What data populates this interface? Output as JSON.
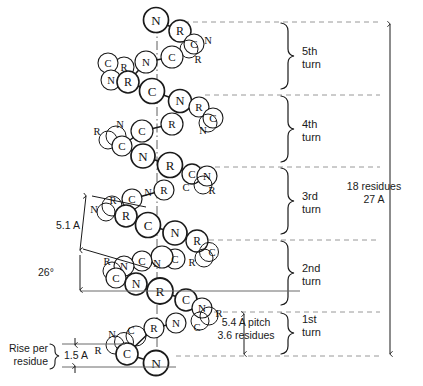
{
  "figure": {
    "background_color": "#ffffff",
    "ink_color": "#1a1a1a"
  },
  "turn_brackets": [
    {
      "label": "5th\nturn",
      "index": 5
    },
    {
      "label": "4th\nturn",
      "index": 4
    },
    {
      "label": "3rd\nturn",
      "index": 3
    },
    {
      "label": "2nd\nturn",
      "index": 2
    },
    {
      "label": "1st\nturn",
      "index": 1
    }
  ],
  "annotations": {
    "total_span": "18 residues\n27 A",
    "pitch": "5.4 A pitch\n3.6 residues",
    "radius": "5.1 A",
    "angle": "26°",
    "rise_label": "Rise per\nresidue",
    "rise_value": "1.5 A"
  },
  "atom_labels": {
    "nitrogen": "N",
    "carbon": "C",
    "residue": "R"
  },
  "helix_chain": [
    {
      "t": "N",
      "x": 156,
      "y": 20,
      "r": 12.5,
      "big": true
    },
    {
      "t": "R",
      "x": 180,
      "y": 31,
      "r": 11,
      "big": true
    },
    {
      "t": "C",
      "x": 194,
      "y": 44,
      "r": 10,
      "big": false
    },
    {
      "t": "N",
      "x": 206,
      "y": 40,
      "r": 0,
      "big": false
    },
    {
      "t": "C",
      "x": 172,
      "y": 57,
      "r": 11,
      "big": false
    },
    {
      "t": "R",
      "x": 196,
      "y": 58,
      "r": 0,
      "big": false
    },
    {
      "t": "N",
      "x": 146,
      "y": 62,
      "r": 11,
      "big": false
    },
    {
      "t": "R",
      "x": 124,
      "y": 67,
      "r": 10,
      "big": false
    },
    {
      "t": "C",
      "x": 108,
      "y": 63,
      "r": 10,
      "big": false
    },
    {
      "t": "N",
      "x": 111,
      "y": 80,
      "r": 10,
      "big": false
    },
    {
      "t": "R",
      "x": 128,
      "y": 82,
      "r": 11,
      "big": true
    },
    {
      "t": "C",
      "x": 152,
      "y": 91,
      "r": 12.5,
      "big": true
    },
    {
      "t": "N",
      "x": 180,
      "y": 101,
      "r": 11.5,
      "big": true
    },
    {
      "t": "R",
      "x": 199,
      "y": 107,
      "r": 10,
      "big": false
    },
    {
      "t": "C",
      "x": 213,
      "y": 118,
      "r": 10,
      "big": false
    },
    {
      "t": "N",
      "x": 200,
      "y": 128,
      "r": 0,
      "big": false
    },
    {
      "t": "R",
      "x": 172,
      "y": 124,
      "r": 11,
      "big": false
    },
    {
      "t": "C",
      "x": 142,
      "y": 131,
      "r": 11,
      "big": false
    },
    {
      "t": "N",
      "x": 120,
      "y": 127,
      "r": 0,
      "big": false
    },
    {
      "t": "R",
      "x": 100,
      "y": 131,
      "r": 0,
      "big": false
    },
    {
      "t": "C",
      "x": 122,
      "y": 146,
      "r": 10,
      "big": false
    },
    {
      "t": "N",
      "x": 143,
      "y": 156,
      "r": 12,
      "big": true
    },
    {
      "t": "R",
      "x": 170,
      "y": 165,
      "r": 12.5,
      "big": true
    },
    {
      "t": "C",
      "x": 192,
      "y": 174,
      "r": 10,
      "big": false
    },
    {
      "t": "N",
      "x": 207,
      "y": 176,
      "r": 10,
      "big": false
    },
    {
      "t": "R",
      "x": 213,
      "y": 190,
      "r": 0,
      "big": false
    },
    {
      "t": "C",
      "x": 183,
      "y": 188,
      "r": 0,
      "big": false
    },
    {
      "t": "R",
      "x": 164,
      "y": 190,
      "r": 10,
      "big": false
    },
    {
      "t": "N",
      "x": 151,
      "y": 195,
      "r": 0,
      "big": false
    },
    {
      "t": "C",
      "x": 132,
      "y": 199,
      "r": 10,
      "big": false
    },
    {
      "t": "R",
      "x": 111,
      "y": 204,
      "r": 0,
      "big": false
    },
    {
      "t": "N",
      "x": 97,
      "y": 211,
      "r": 0,
      "big": false
    },
    {
      "t": "R",
      "x": 126,
      "y": 216,
      "r": 11,
      "big": true
    },
    {
      "t": "C",
      "x": 148,
      "y": 225,
      "r": 12.5,
      "big": true
    },
    {
      "t": "N",
      "x": 175,
      "y": 233,
      "r": 12,
      "big": true
    },
    {
      "t": "R",
      "x": 197,
      "y": 241,
      "r": 11,
      "big": false
    },
    {
      "t": "C",
      "x": 211,
      "y": 250,
      "r": 0,
      "big": false
    },
    {
      "t": "R",
      "x": 190,
      "y": 259,
      "r": 0,
      "big": false
    },
    {
      "t": "C",
      "x": 175,
      "y": 259,
      "r": 10,
      "big": false
    },
    {
      "t": "N",
      "x": 157,
      "y": 262,
      "r": 0,
      "big": false
    },
    {
      "t": "R",
      "x": 162,
      "y": 257,
      "r": 11,
      "big": false
    },
    {
      "t": "C",
      "x": 142,
      "y": 261,
      "r": 10,
      "big": false
    },
    {
      "t": "N",
      "x": 124,
      "y": 266,
      "r": 10,
      "big": false
    },
    {
      "t": "R",
      "x": 110,
      "y": 262,
      "r": 0,
      "big": false
    },
    {
      "t": "C",
      "x": 116,
      "y": 278,
      "r": 10,
      "big": false
    },
    {
      "t": "N",
      "x": 136,
      "y": 284,
      "r": 11,
      "big": true
    },
    {
      "t": "R",
      "x": 160,
      "y": 291,
      "r": 13,
      "big": true
    },
    {
      "t": "C",
      "x": 186,
      "y": 300,
      "r": 11,
      "big": true
    },
    {
      "t": "N",
      "x": 202,
      "y": 308,
      "r": 10,
      "big": false
    },
    {
      "t": "R",
      "x": 216,
      "y": 312,
      "r": 0,
      "big": false
    },
    {
      "t": "C",
      "x": 197,
      "y": 325,
      "r": 0,
      "big": false
    },
    {
      "t": "N",
      "x": 176,
      "y": 323,
      "r": 10,
      "big": false
    },
    {
      "t": "R",
      "x": 154,
      "y": 328,
      "r": 10,
      "big": false
    },
    {
      "t": "C",
      "x": 133,
      "y": 332,
      "r": 0,
      "big": false
    },
    {
      "t": "N",
      "x": 114,
      "y": 336,
      "r": 0,
      "big": false
    },
    {
      "t": "R",
      "x": 100,
      "y": 348,
      "r": 0,
      "big": false
    },
    {
      "t": "C",
      "x": 127,
      "y": 354,
      "r": 11,
      "big": true
    },
    {
      "t": "N",
      "x": 156,
      "y": 363,
      "r": 12.5,
      "big": true
    }
  ],
  "guide_lines": {
    "dashed_y_positions": [
      22,
      95,
      167,
      240,
      312,
      356
    ],
    "axis_x": 157,
    "span_arrow_x": 390,
    "pitch_arrow_x": 244
  }
}
